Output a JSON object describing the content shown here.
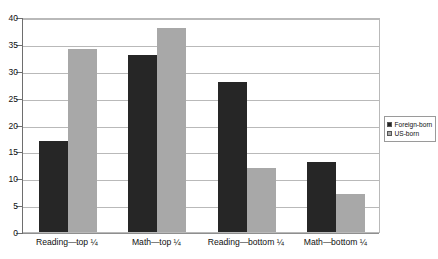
{
  "chart_data": {
    "type": "bar",
    "title": "",
    "subtitle": "",
    "xlabel": "",
    "ylabel": "",
    "ylim": [
      0,
      40
    ],
    "ytick_step": 5,
    "ytick_labels": [
      "40",
      "35",
      "30",
      "25",
      "20",
      "15",
      "10",
      "5",
      "0"
    ],
    "grid": true,
    "grid_orientation": "horizontal",
    "legend_position": "right",
    "categories": [
      "Reading—top ¼",
      "Math—top ¼",
      "Reading—bottom ¼",
      "Math—bottom ¼"
    ],
    "series": [
      {
        "name": "Foreign-born",
        "color": "#262626",
        "values": [
          17,
          33,
          28,
          13
        ]
      },
      {
        "name": "US-born",
        "color": "#a8a8a8",
        "values": [
          34,
          38,
          12,
          7
        ]
      }
    ]
  },
  "legend": {
    "items": [
      {
        "label": "Foreign-born",
        "color": "#262626"
      },
      {
        "label": "US-born",
        "color": "#a8a8a8"
      }
    ]
  },
  "colors": {
    "foreign_born": "#262626",
    "us_born": "#a8a8a8",
    "gridline": "#b9b9b9",
    "axis": "#6e6e6e",
    "background": "#ffffff"
  }
}
